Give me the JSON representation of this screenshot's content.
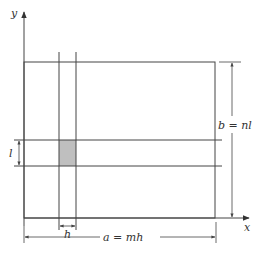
{
  "diagram": {
    "axes": {
      "y_label": "y",
      "x_label": "x"
    },
    "dimensions": {
      "height_label": "b = nl",
      "width_label": "a = mh",
      "cell_width_label": "h",
      "cell_height_label": "l"
    },
    "colors": {
      "line": "#444444",
      "cell_fill": "#bfbfbf",
      "background": "#ffffff"
    }
  }
}
